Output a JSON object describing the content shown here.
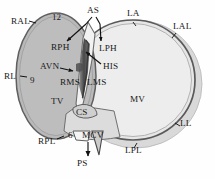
{
  "figure": {
    "type": "anatomical-diagram",
    "colors": {
      "background": "#fefefe",
      "tv_fill": "#b9b9b9",
      "mv_fill": "#e3e3e3",
      "mv_halo": "#d6d6d6",
      "annulus_stroke": "#555555",
      "outline_stroke": "#6b6b6b",
      "septum_dark": "#4a4a4a",
      "label_color": "#1a1a1a",
      "arrow_color": "#111111"
    }
  },
  "labels": {
    "ral": "RAL",
    "as": "AS",
    "la": "LA",
    "lal": "LAL",
    "rph": "RPH",
    "lph": "LPH",
    "rl": "RL",
    "avn": "AVN",
    "his": "HIS",
    "rms": "RMS",
    "lms": "LMS",
    "tv": "TV",
    "mv": "MV",
    "cs": "CS",
    "ll": "LL",
    "rpl": "RPL",
    "mcv": "MCV",
    "lpl": "LPL",
    "ps": "PS"
  },
  "clock_markers": {
    "twelve": "12",
    "nine": "9",
    "six": "6"
  },
  "label_positions": [
    {
      "key": "ral",
      "text": "RAL",
      "x": 11,
      "y": 21
    },
    {
      "key": "twelve",
      "text": "12",
      "x": 52,
      "y": 17
    },
    {
      "key": "as",
      "text": "AS",
      "x": 87,
      "y": 11
    },
    {
      "key": "la",
      "text": "LA",
      "x": 127,
      "y": 14
    },
    {
      "key": "lal",
      "text": "LAL",
      "x": 176,
      "y": 26
    },
    {
      "key": "rph",
      "text": "RPH",
      "x": 52,
      "y": 47
    },
    {
      "key": "lph",
      "text": "LPH",
      "x": 98,
      "y": 48
    },
    {
      "key": "rl",
      "text": "RL",
      "x": 6,
      "y": 76
    },
    {
      "key": "nine",
      "text": "9",
      "x": 33,
      "y": 80
    },
    {
      "key": "avn",
      "text": "AVN",
      "x": 43,
      "y": 65
    },
    {
      "key": "his",
      "text": "HIS",
      "x": 103,
      "y": 66
    },
    {
      "key": "rms",
      "text": "RMS",
      "x": 62,
      "y": 81
    },
    {
      "key": "lms",
      "text": "LMS",
      "x": 88,
      "y": 81
    },
    {
      "key": "tv",
      "text": "TV",
      "x": 52,
      "y": 101
    },
    {
      "key": "mv",
      "text": "MV",
      "x": 131,
      "y": 99
    },
    {
      "key": "cs",
      "text": "CS",
      "x": 77,
      "y": 112
    },
    {
      "key": "ll",
      "text": "LL",
      "x": 181,
      "y": 123
    },
    {
      "key": "six",
      "text": "6",
      "x": 70,
      "y": 135
    },
    {
      "key": "rpl",
      "text": "RPL",
      "x": 41,
      "y": 141
    },
    {
      "key": "mcv",
      "text": "MCV",
      "x": 84,
      "y": 135
    },
    {
      "key": "lpl",
      "text": "LPL",
      "x": 127,
      "y": 150
    },
    {
      "key": "ps",
      "text": "PS",
      "x": 79,
      "y": 163
    }
  ],
  "annotations": {
    "arrows": [
      {
        "name": "as-to-rph",
        "from": [
          89,
          20
        ],
        "to": [
          66,
          41
        ]
      },
      {
        "name": "as-to-lph",
        "from": [
          96,
          20
        ],
        "to": [
          100,
          42
        ]
      },
      {
        "name": "avn-to-septum",
        "from": [
          60,
          68
        ],
        "to": [
          74,
          71
        ]
      },
      {
        "name": "his-to-septum",
        "from": [
          101,
          65
        ],
        "to": [
          85,
          52
        ]
      },
      {
        "name": "mcv-to-ps",
        "from": [
          88,
          141
        ],
        "to": [
          88,
          155
        ]
      }
    ]
  }
}
